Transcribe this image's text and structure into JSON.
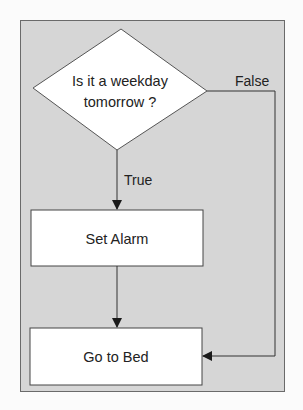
{
  "diagram": {
    "type": "flowchart",
    "colors": {
      "background": "#fbfbfb",
      "frame_fill": "#d6d6d6",
      "frame_border": "#6a6a6a",
      "node_fill": "#ffffff",
      "node_border": "#444444",
      "edge": "#333333",
      "text": "#222222"
    },
    "nodes": [
      {
        "id": "decision",
        "shape": "diamond",
        "lines": [
          "Is it a weekday",
          "tomorrow ?"
        ]
      },
      {
        "id": "set_alarm",
        "shape": "rectangle",
        "label": "Set Alarm"
      },
      {
        "id": "go_to_bed",
        "shape": "rectangle",
        "label": "Go to Bed"
      }
    ],
    "edges": [
      {
        "from": "decision",
        "to": "set_alarm",
        "label": "True"
      },
      {
        "from": "set_alarm",
        "to": "go_to_bed",
        "label": ""
      },
      {
        "from": "decision",
        "to": "go_to_bed",
        "label": "False"
      }
    ]
  }
}
